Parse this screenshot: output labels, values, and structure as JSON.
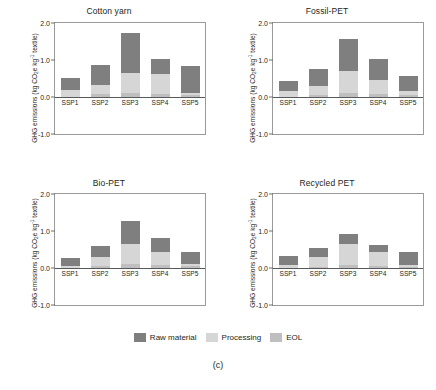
{
  "figure": {
    "caption": "(c)",
    "ylabel_main": "GHG emissions (kg CO",
    "ylabel_sub": "2",
    "ylabel_mid": "e kg",
    "ylabel_sup": "-1",
    "ylabel_end": " textile)"
  },
  "legend": {
    "position": "bottom-center",
    "items": [
      {
        "label": "Raw material",
        "color": "#7f7f7f",
        "swatch_name": "legend-swatch-raw-material"
      },
      {
        "label": "Processing",
        "color": "#d6d6d6",
        "swatch_name": "legend-swatch-processing"
      },
      {
        "label": "EOL",
        "color": "#bfbfbf",
        "swatch_name": "legend-swatch-eol"
      }
    ]
  },
  "axis": {
    "ylim": [
      -1.0,
      2.0
    ],
    "yticks": [
      "2.0",
      "1.0",
      "0.0",
      "-1.0"
    ],
    "ytick_values": [
      2.0,
      1.0,
      0.0,
      -1.0
    ],
    "categories": [
      "SSP1",
      "SSP2",
      "SSP3",
      "SSP4",
      "SSP5"
    ]
  },
  "chart_data": {
    "type": "bar",
    "title": "",
    "xlabel": "",
    "ylabel": "GHG emissions (kg CO2e kg-1 textile)",
    "ylim": [
      -1.0,
      2.0
    ],
    "yticks": [
      -1.0,
      0.0,
      1.0,
      2.0
    ],
    "grid": false,
    "stacked": true,
    "legend_position": "bottom-center",
    "categories": [
      "SSP1",
      "SSP2",
      "SSP3",
      "SSP4",
      "SSP5"
    ],
    "series_order_bottom_to_top": [
      "EOL",
      "Processing",
      "Raw material"
    ],
    "panels": [
      {
        "title": "Cotton yarn",
        "series": [
          {
            "name": "EOL",
            "color": "#bfbfbf",
            "values": [
              0.0,
              0.07,
              0.11,
              0.09,
              0.06
            ]
          },
          {
            "name": "Processing",
            "color": "#d6d6d6",
            "values": [
              0.2,
              0.26,
              0.55,
              0.52,
              0.06
            ]
          },
          {
            "name": "Raw material",
            "color": "#7f7f7f",
            "values": [
              0.32,
              0.54,
              1.07,
              0.41,
              0.72
            ]
          }
        ],
        "totals": [
          0.52,
          0.87,
          1.73,
          1.02,
          0.84
        ]
      },
      {
        "title": "Fossil-PET",
        "series": [
          {
            "name": "EOL",
            "color": "#bfbfbf",
            "values": [
              0.0,
              0.06,
              0.1,
              0.08,
              0.05
            ]
          },
          {
            "name": "Processing",
            "color": "#d6d6d6",
            "values": [
              0.15,
              0.24,
              0.59,
              0.38,
              0.12
            ]
          },
          {
            "name": "Raw material",
            "color": "#7f7f7f",
            "values": [
              0.28,
              0.46,
              0.88,
              0.56,
              0.4
            ]
          }
        ],
        "totals": [
          0.43,
          0.76,
          1.57,
          1.02,
          0.57
        ]
      },
      {
        "title": "Bio-PET",
        "series": [
          {
            "name": "EOL",
            "color": "#bfbfbf",
            "values": [
              0.0,
              0.06,
              0.1,
              0.08,
              0.05
            ]
          },
          {
            "name": "Processing",
            "color": "#d6d6d6",
            "values": [
              0.05,
              0.24,
              0.56,
              0.36,
              0.05
            ]
          },
          {
            "name": "Raw material",
            "color": "#7f7f7f",
            "values": [
              0.21,
              0.29,
              0.6,
              0.38,
              0.32
            ]
          }
        ],
        "totals": [
          0.26,
          0.59,
          1.26,
          0.82,
          0.42
        ]
      },
      {
        "title": "Recycled PET",
        "series": [
          {
            "name": "EOL",
            "color": "#bfbfbf",
            "values": [
              0.0,
              0.04,
              0.08,
              0.05,
              0.03
            ]
          },
          {
            "name": "Processing",
            "color": "#d6d6d6",
            "values": [
              0.08,
              0.27,
              0.56,
              0.39,
              0.06
            ]
          },
          {
            "name": "Raw material",
            "color": "#7f7f7f",
            "values": [
              0.25,
              0.23,
              0.27,
              0.17,
              0.34
            ]
          }
        ],
        "totals": [
          0.33,
          0.54,
          0.91,
          0.61,
          0.43
        ]
      }
    ]
  }
}
